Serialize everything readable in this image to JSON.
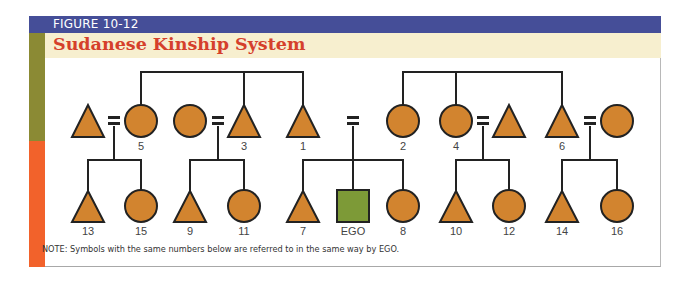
{
  "figure": {
    "label": "FIGURE 10-12",
    "title": "Sudanese Kinship System",
    "note": "NOTE: Symbols with the same numbers below are referred to in the same way by EGO."
  },
  "colors": {
    "header_blue": "#454e98",
    "title_red": "#d5402b",
    "header_beige": "#f7efcf",
    "side_olive": "#8b8a34",
    "side_orange": "#f2622b",
    "kin_fill": "#d2842f",
    "ego_fill": "#7d9a37",
    "line": "#222222"
  },
  "generation_1": [
    {
      "id": "n13_parent_m",
      "shape": "triangle",
      "label": "",
      "x": 88
    },
    {
      "id": "n5",
      "shape": "circle",
      "label": "5",
      "x": 141
    },
    {
      "id": "n_spouse3",
      "shape": "circle",
      "label": "",
      "x": 190
    },
    {
      "id": "n3",
      "shape": "triangle",
      "label": "3",
      "x": 244
    },
    {
      "id": "n1",
      "shape": "triangle",
      "label": "1",
      "x": 303
    },
    {
      "id": "n2",
      "shape": "circle",
      "label": "2",
      "x": 403
    },
    {
      "id": "n4",
      "shape": "circle",
      "label": "4",
      "x": 456
    },
    {
      "id": "n_spouse4",
      "shape": "triangle",
      "label": "",
      "x": 509
    },
    {
      "id": "n6",
      "shape": "triangle",
      "label": "6",
      "x": 562
    },
    {
      "id": "n_spouse6",
      "shape": "circle",
      "label": "",
      "x": 617
    }
  ],
  "generation_2": [
    {
      "id": "n13",
      "shape": "triangle",
      "label": "13",
      "x": 88
    },
    {
      "id": "n15",
      "shape": "circle",
      "label": "15",
      "x": 141
    },
    {
      "id": "n9",
      "shape": "triangle",
      "label": "9",
      "x": 190
    },
    {
      "id": "n11",
      "shape": "circle",
      "label": "11",
      "x": 244
    },
    {
      "id": "n7",
      "shape": "triangle",
      "label": "7",
      "x": 303
    },
    {
      "id": "ego",
      "shape": "square",
      "label": "EGO",
      "x": 353
    },
    {
      "id": "n8",
      "shape": "circle",
      "label": "8",
      "x": 403
    },
    {
      "id": "n10",
      "shape": "triangle",
      "label": "10",
      "x": 456
    },
    {
      "id": "n12",
      "shape": "circle",
      "label": "12",
      "x": 509
    },
    {
      "id": "n14",
      "shape": "triangle",
      "label": "14",
      "x": 562
    },
    {
      "id": "n16",
      "shape": "circle",
      "label": "16",
      "x": 617
    }
  ],
  "labels": {
    "g1": [
      "5",
      "3",
      "1",
      "2",
      "4",
      "6"
    ],
    "g2": [
      "13",
      "15",
      "9",
      "11",
      "7",
      "EGO",
      "8",
      "10",
      "12",
      "14",
      "16"
    ]
  }
}
